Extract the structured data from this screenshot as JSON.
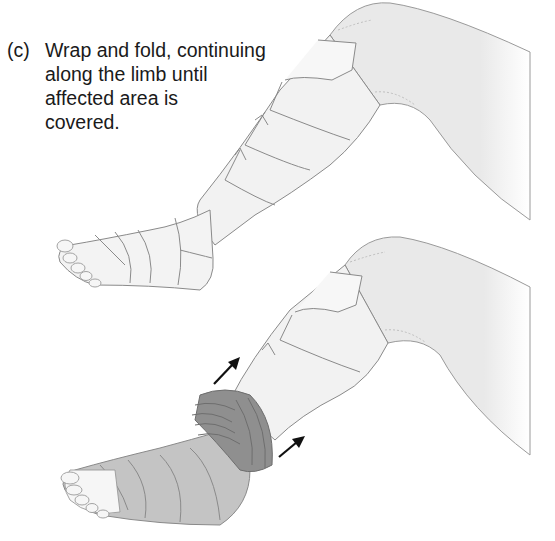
{
  "figure": {
    "step_label": "(c)",
    "instruction_lines": [
      "Wrap and fold, continuing",
      "along the limb until",
      "affected area is",
      "covered."
    ],
    "panels": [
      {
        "name": "leg-fully-wrapped",
        "description": "Bent leg with bandage wrapped and folded from foot up to knee"
      },
      {
        "name": "leg-wrap-in-progress",
        "description": "Bent leg with dark compression wrap rolled at ankle, arrows pointing up the limb"
      }
    ],
    "arrows": [
      "arrow-up-limb-left",
      "arrow-up-limb-right"
    ],
    "colors": {
      "skin": "#ececec",
      "outline": "#8a8a8a",
      "bandage_light": "#f4f4f4",
      "bandage_mid": "#bdbdbd",
      "bandage_dark": "#8f8f8f",
      "arrow": "#111111",
      "text": "#1a1a1a"
    }
  }
}
